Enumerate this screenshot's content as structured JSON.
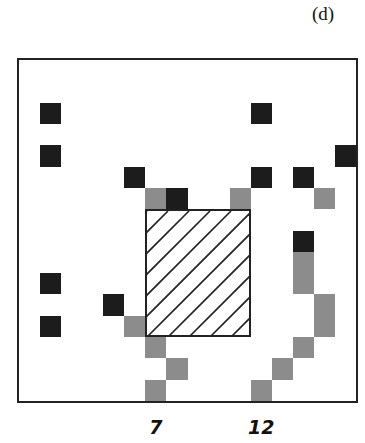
{
  "panel_label": "(d)",
  "grid": {
    "size": 16,
    "colors": {
      "black": "#1c1c1c",
      "gray": "#8c8c8c",
      "frame": "#222222"
    },
    "cells": [
      {
        "row": 3,
        "col": 2,
        "type": "black"
      },
      {
        "row": 3,
        "col": 12,
        "type": "black"
      },
      {
        "row": 5,
        "col": 2,
        "type": "black"
      },
      {
        "row": 5,
        "col": 16,
        "type": "black"
      },
      {
        "row": 6,
        "col": 6,
        "type": "black"
      },
      {
        "row": 6,
        "col": 12,
        "type": "black"
      },
      {
        "row": 6,
        "col": 14,
        "type": "black"
      },
      {
        "row": 7,
        "col": 7,
        "type": "gray"
      },
      {
        "row": 7,
        "col": 8,
        "type": "black"
      },
      {
        "row": 7,
        "col": 11,
        "type": "gray"
      },
      {
        "row": 7,
        "col": 15,
        "type": "gray"
      },
      {
        "row": 9,
        "col": 14,
        "type": "black"
      },
      {
        "row": 10,
        "col": 14,
        "type": "gray"
      },
      {
        "row": 11,
        "col": 14,
        "type": "gray"
      },
      {
        "row": 11,
        "col": 2,
        "type": "black"
      },
      {
        "row": 12,
        "col": 5,
        "type": "black"
      },
      {
        "row": 12,
        "col": 15,
        "type": "gray"
      },
      {
        "row": 13,
        "col": 2,
        "type": "black"
      },
      {
        "row": 13,
        "col": 6,
        "type": "gray"
      },
      {
        "row": 13,
        "col": 15,
        "type": "gray"
      },
      {
        "row": 14,
        "col": 7,
        "type": "gray"
      },
      {
        "row": 14,
        "col": 14,
        "type": "gray"
      },
      {
        "row": 15,
        "col": 8,
        "type": "gray"
      },
      {
        "row": 15,
        "col": 13,
        "type": "gray"
      },
      {
        "row": 16,
        "col": 7,
        "type": "gray"
      },
      {
        "row": 16,
        "col": 12,
        "type": "gray"
      }
    ],
    "hatched_region": {
      "col_start": 7,
      "col_end": 11,
      "row_start": 8,
      "row_end": 13
    }
  },
  "x_axis_labels": [
    {
      "text": "7",
      "col": 7
    },
    {
      "text": "12",
      "col": 12
    }
  ]
}
